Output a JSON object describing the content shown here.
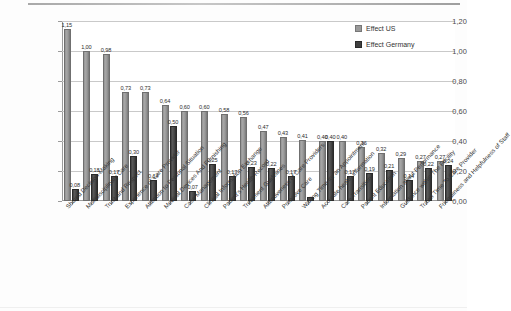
{
  "legend": {
    "position": "top-right",
    "items": [
      {
        "label": "Effect US",
        "color": "#9a9a9a",
        "key": "us"
      },
      {
        "label": "Effect Germany",
        "color": "#3f3f3f",
        "key": "de"
      }
    ]
  },
  "axis": {
    "y_ticks": [
      "0,00",
      "0,20",
      "0,40",
      "0,60",
      "0,80",
      "1,00",
      "1,20"
    ]
  },
  "chart_data": {
    "type": "bar",
    "title": "",
    "subtitle": "",
    "xlabel": "",
    "ylabel": "",
    "ylim": [
      0,
      1.2
    ],
    "ytick_step": 0.2,
    "grid": true,
    "decimal_separator": ",",
    "legend_position": "top-right",
    "orientation": "vertical",
    "grouping": "grouped",
    "categories": [
      "Shared Decision-Making",
      "Multidisciplinary Care",
      "Trust and  Respect",
      "Experience of Care Provider",
      "Attention to Personal Situation",
      "Medical Devices And Furnishing",
      "Case Management",
      "Clinical Information  Exchange",
      "Patient's Health Record",
      "Treatment Guidelines",
      "Attentiveness of Care Providers",
      "Proactive Care",
      "Waiting Time  for an Appointment",
      "Accurate health information",
      "Care Transition",
      "Patient Education",
      "Information about Performance",
      "Guidance within The Facility",
      "Travel Time  To Care Provider",
      "Friendliness and Helpfulness of Staff"
    ],
    "series": [
      {
        "name": "Effect US",
        "color": "#9a9a9a",
        "values": [
          1.15,
          1.0,
          0.98,
          0.73,
          0.73,
          0.64,
          0.6,
          0.6,
          0.58,
          0.56,
          0.47,
          0.43,
          0.41,
          0.4,
          0.4,
          0.36,
          0.32,
          0.29,
          0.27,
          0.27
        ],
        "labels": [
          "1,15",
          "1,00",
          "0,98",
          "0,73",
          "0,73",
          "0,64",
          "0,60",
          "0,60",
          "0,58",
          "0,56",
          "0,47",
          "0,43",
          "0,41",
          "0,40",
          "0,40",
          "0,36",
          "0,32",
          "0,29",
          "0,27",
          "0,27"
        ]
      },
      {
        "name": "Effect Germany",
        "color": "#3f3f3f",
        "values": [
          0.08,
          0.18,
          0.17,
          0.3,
          0.14,
          0.5,
          0.07,
          0.25,
          0.17,
          0.23,
          0.22,
          0.17,
          0.03,
          0.4,
          0.17,
          0.19,
          0.21,
          0.14,
          0.22,
          0.24
        ],
        "labels": [
          "0,08",
          "0,18",
          "0,17",
          "0,30",
          "0,14",
          "0,50",
          "0,07",
          "0,25",
          "0,17",
          "0,23",
          "0,22",
          "0,17",
          "",
          "0,40",
          "0,17",
          "0,19",
          "0,21",
          "0,14",
          "0,22",
          "0,24"
        ]
      }
    ],
    "trailing_extra": {
      "note": "last pair labels",
      "us_tail": [
        "0,23",
        "0,21"
      ],
      "de_tail": [
        "0,21",
        "0,19"
      ]
    }
  }
}
